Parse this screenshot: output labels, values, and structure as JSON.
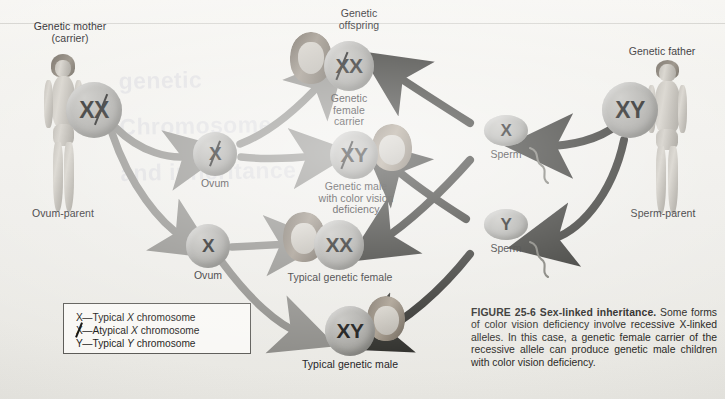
{
  "figure": {
    "number": "FIGURE 25-6",
    "title": "Sex-linked inheritance.",
    "caption": " Some forms of color vision deficiency involve recessive X-linked alleles. In this case, a genetic female carrier of the recessive allele can produce genetic male children with color vision deficiency."
  },
  "parents": {
    "mother": {
      "label_line1": "Genetic mother",
      "label_line2": "(carrier)",
      "genotype": "XX",
      "genotype_atypical_second": true,
      "role_label": "Ovum-parent"
    },
    "father": {
      "label_line1": "Genetic father",
      "genotype": "XY",
      "role_label": "Sperm-parent"
    }
  },
  "gametes": {
    "ova": [
      {
        "genotype": "X",
        "atypical": true,
        "label": "Ovum"
      },
      {
        "genotype": "X",
        "atypical": false,
        "label": "Ovum"
      }
    ],
    "sperm": [
      {
        "genotype": "X",
        "label": "Sperm"
      },
      {
        "genotype": "Y",
        "label": "Sperm"
      }
    ]
  },
  "offspring_header": {
    "line1": "Genetic",
    "line2": "offspring"
  },
  "offspring": [
    {
      "genotype": "XX",
      "atypical_index": 1,
      "label_lines": [
        "Genetic",
        "female",
        "carrier"
      ]
    },
    {
      "genotype": "XY",
      "atypical_index": 0,
      "label_lines": [
        "Genetic male",
        "with color vision",
        "deficiency"
      ]
    },
    {
      "genotype": "XX",
      "atypical_index": -1,
      "label_lines": [
        "Typical genetic female"
      ]
    },
    {
      "genotype": "XY",
      "atypical_index": -1,
      "label_lines": [
        "Typical genetic male"
      ]
    }
  ],
  "legend": {
    "rows": [
      {
        "symbol": "X",
        "atypical": false,
        "dash": "—",
        "text_before": "Typical ",
        "italic": "X",
        "text_after": " chromosome"
      },
      {
        "symbol": "X",
        "atypical": true,
        "dash": "—",
        "text_before": "Atypical ",
        "italic": "X",
        "text_after": " chromosome"
      },
      {
        "symbol": "Y",
        "atypical": false,
        "dash": "—",
        "text_before": "Typical ",
        "italic": "Y",
        "text_after": " chromosome"
      }
    ]
  },
  "ghost_text": {
    "line1": "genetic",
    "line2": "Chromosome",
    "line3": "and inheritance"
  },
  "colors": {
    "page_background": "#f2f1ed",
    "circle_fill": "#a9a8a4",
    "circle_text": "#141413",
    "arrow_light": "#8b8a86",
    "arrow_dark": "#2b2a28",
    "legend_border": "#5d5c58",
    "label_text": "#23221f"
  }
}
